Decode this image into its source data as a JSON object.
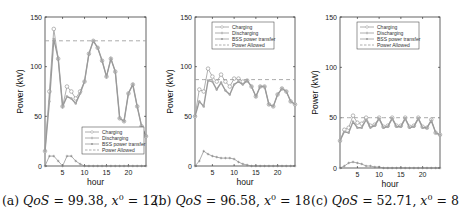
{
  "chart_data": [
    {
      "type": "line",
      "title": "",
      "caption": "(a) QoS = 99.38, x⁰ = 12",
      "caption_parts": {
        "label": "(a)",
        "qos": "99.38",
        "x0": "12"
      },
      "xlabel": "hour",
      "ylabel": "Power (kW)",
      "xlim": [
        1,
        24
      ],
      "ylim": [
        0,
        150
      ],
      "xticks": [
        5,
        10,
        15,
        20
      ],
      "yticks": [
        0,
        50,
        100,
        150
      ],
      "grid": false,
      "legend_position": "lower right",
      "x": [
        1,
        2,
        3,
        4,
        5,
        6,
        7,
        8,
        9,
        10,
        11,
        12,
        13,
        14,
        15,
        16,
        17,
        18,
        19,
        20,
        21,
        22,
        23,
        24
      ],
      "series": [
        {
          "name": "Charging",
          "marker": "circle",
          "values": [
            15,
            75,
            138,
            108,
            60,
            80,
            75,
            68,
            75,
            85,
            113,
            126,
            119,
            106,
            90,
            108,
            95,
            48,
            45,
            73,
            82,
            60,
            40,
            30
          ]
        },
        {
          "name": "Discharging",
          "marker": "plus",
          "values": [
            0,
            10,
            10,
            5,
            0,
            10,
            10,
            5,
            2,
            0,
            0,
            0,
            0,
            0,
            0,
            0,
            0,
            0,
            0,
            0,
            0,
            0,
            0,
            0
          ]
        },
        {
          "name": "BSS power transfer",
          "marker": "dot",
          "values": [
            15,
            65,
            128,
            108,
            60,
            70,
            68,
            63,
            73,
            85,
            113,
            126,
            119,
            106,
            90,
            108,
            95,
            48,
            45,
            73,
            82,
            60,
            40,
            30
          ]
        },
        {
          "name": "Power Allowed",
          "marker": "dashed",
          "values": [
            126,
            126,
            126,
            126,
            126,
            126,
            126,
            126,
            126,
            126,
            126,
            126,
            126,
            126,
            126,
            126,
            126,
            126,
            126,
            126,
            126,
            126,
            126,
            126
          ]
        }
      ]
    },
    {
      "type": "line",
      "title": "",
      "caption": "(b) QoS = 96.58, x⁰ = 18",
      "caption_parts": {
        "label": "(b)",
        "qos": "96.58",
        "x0": "18"
      },
      "xlabel": "hour",
      "ylabel": "Power (kW)",
      "xlim": [
        1,
        24
      ],
      "ylim": [
        0,
        150
      ],
      "xticks": [
        5,
        10,
        15,
        20
      ],
      "yticks": [
        0,
        50,
        100,
        150
      ],
      "grid": false,
      "legend_position": "upper center",
      "x": [
        1,
        2,
        3,
        4,
        5,
        6,
        7,
        8,
        9,
        10,
        11,
        12,
        13,
        14,
        15,
        16,
        17,
        18,
        19,
        20,
        21,
        22,
        23,
        24
      ],
      "series": [
        {
          "name": "Charging",
          "marker": "circle",
          "values": [
            50,
            77,
            75,
            98,
            90,
            85,
            92,
            85,
            80,
            88,
            88,
            85,
            86,
            80,
            70,
            80,
            80,
            62,
            60,
            72,
            78,
            75,
            65,
            62
          ]
        },
        {
          "name": "Discharging",
          "marker": "plus",
          "values": [
            0,
            5,
            15,
            12,
            10,
            9,
            8,
            8,
            8,
            7,
            4,
            2,
            1,
            0,
            0,
            0,
            0,
            0,
            0,
            0,
            0,
            0,
            0,
            0
          ]
        },
        {
          "name": "BSS power transfer",
          "marker": "dot",
          "values": [
            50,
            65,
            60,
            86,
            85,
            77,
            84,
            76,
            72,
            82,
            85,
            82,
            86,
            80,
            70,
            80,
            80,
            62,
            60,
            72,
            78,
            75,
            65,
            62
          ]
        },
        {
          "name": "Power Allowed",
          "marker": "dashed",
          "values": [
            87,
            87,
            87,
            87,
            87,
            87,
            87,
            87,
            87,
            87,
            87,
            87,
            87,
            87,
            87,
            87,
            87,
            87,
            87,
            87,
            87,
            87,
            87,
            87
          ]
        }
      ]
    },
    {
      "type": "line",
      "title": "",
      "caption": "(c) QoS = 52.71, x⁰ = 8",
      "caption_parts": {
        "label": "(c)",
        "qos": "52.71",
        "x0": "8"
      },
      "xlabel": "hour",
      "ylabel": "Power (kW)",
      "xlim": [
        1,
        24
      ],
      "ylim": [
        0,
        150
      ],
      "xticks": [
        5,
        10,
        15,
        20
      ],
      "yticks": [
        0,
        50,
        100,
        150
      ],
      "grid": false,
      "legend_position": "upper center",
      "x": [
        1,
        2,
        3,
        4,
        5,
        6,
        7,
        8,
        9,
        10,
        11,
        12,
        13,
        14,
        15,
        16,
        17,
        18,
        19,
        20,
        21,
        22,
        23,
        24
      ],
      "series": [
        {
          "name": "Charging",
          "marker": "circle",
          "values": [
            27,
            38,
            40,
            52,
            45,
            44,
            50,
            42,
            43,
            50,
            41,
            42,
            50,
            42,
            42,
            50,
            41,
            42,
            50,
            41,
            40,
            48,
            35,
            33
          ]
        },
        {
          "name": "Discharging",
          "marker": "plus",
          "values": [
            0,
            2,
            5,
            6,
            5,
            4,
            2,
            2,
            1,
            1,
            0,
            0,
            0,
            0,
            0,
            0,
            0,
            0,
            0,
            0,
            0,
            0,
            0,
            0
          ]
        },
        {
          "name": "BSS power transfer",
          "marker": "dot",
          "values": [
            27,
            36,
            35,
            46,
            40,
            40,
            48,
            40,
            42,
            49,
            40,
            41,
            49,
            41,
            41,
            49,
            40,
            41,
            49,
            40,
            40,
            47,
            35,
            33
          ]
        },
        {
          "name": "Power Allowed",
          "marker": "dashed",
          "values": [
            50,
            50,
            50,
            50,
            50,
            50,
            50,
            50,
            50,
            50,
            50,
            50,
            50,
            50,
            50,
            50,
            50,
            50,
            50,
            50,
            50,
            50,
            50,
            50
          ]
        }
      ]
    }
  ],
  "legend": [
    "Charging",
    "Discharging",
    "BSS power transfer",
    "Power Allowed"
  ],
  "colors": {
    "lines": "#9a9a9a",
    "axis": "#222222",
    "text": "#111111"
  }
}
